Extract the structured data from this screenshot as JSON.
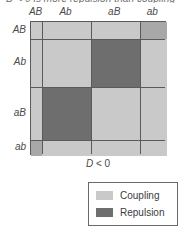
{
  "figure": {
    "clipped_caption": "D < 0 is more repulsion than coupling",
    "d_label_variable": "D",
    "d_label_relation": " < 0"
  },
  "colors": {
    "coupling": "#c9c9c9",
    "repulsion": "#6e6e6e",
    "corner": "#a8a8a8",
    "gridline": "#5a5a5a",
    "background": "#ffffff"
  },
  "axes": {
    "columns": [
      {
        "label": "AB",
        "weight": 11
      },
      {
        "label": "Ab",
        "weight": 48
      },
      {
        "label": "aB",
        "weight": 48
      },
      {
        "label": "ab",
        "weight": 27
      }
    ],
    "rows": [
      {
        "label": "AB",
        "weight": 17
      },
      {
        "label": "Ab",
        "weight": 48
      },
      {
        "label": "aB",
        "weight": 53
      },
      {
        "label": "ab",
        "weight": 16
      }
    ]
  },
  "chart_data": {
    "type": "heatmap",
    "title": "D < 0 is more repulsion than coupling",
    "xlabel": "D < 0",
    "ylabel": "",
    "grid": true,
    "legend_position": "bottom-right",
    "categories_x": [
      "AB",
      "Ab",
      "aB",
      "ab"
    ],
    "categories_y": [
      "AB",
      "Ab",
      "aB",
      "ab"
    ],
    "cell_states": [
      [
        "coupling",
        "coupling",
        "coupling",
        "corner"
      ],
      [
        "coupling",
        "coupling",
        "repulsion",
        "coupling"
      ],
      [
        "coupling",
        "repulsion",
        "coupling",
        "coupling"
      ],
      [
        "corner",
        "coupling",
        "coupling",
        "coupling"
      ]
    ],
    "state_meaning": {
      "coupling": "Coupling",
      "repulsion": "Repulsion",
      "corner": "Coupling"
    }
  },
  "legend": {
    "items": [
      {
        "label": "Coupling",
        "color": "#c9c9c9"
      },
      {
        "label": "Repulsion",
        "color": "#6e6e6e"
      }
    ]
  }
}
